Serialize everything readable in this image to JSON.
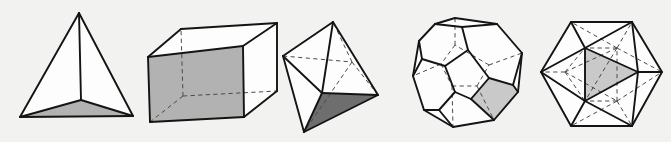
{
  "figure": {
    "background_color": "#f2f2f1",
    "width": 671,
    "height": 142,
    "line_color": "#141414",
    "hidden_line_color": "#4a4a4a",
    "hidden_line_style": "dashed",
    "face_white_color": "#fdfdfd",
    "shade_mid_color": "#b2b2b2",
    "shade_dark_color": "#6e6e6e",
    "shade_light_color": "#c9c9c9"
  },
  "solids": [
    {
      "id": "tetrahedron",
      "name": "Tetrahedron",
      "faces": 4,
      "face_shape": "triangle",
      "vertices": 4,
      "edges": 6,
      "shaded_face": "bottom-base",
      "shaded_face_color": "#b2b2b2",
      "hidden_edges_visible": false,
      "label": ""
    },
    {
      "id": "cube",
      "name": "Cube",
      "faces": 6,
      "face_shape": "square",
      "vertices": 8,
      "edges": 12,
      "shaded_face": "front-left",
      "shaded_face_color": "#b2b2b2",
      "hidden_edges_visible": true,
      "label": ""
    },
    {
      "id": "octahedron",
      "name": "Octahedron",
      "faces": 8,
      "face_shape": "triangle",
      "vertices": 6,
      "edges": 12,
      "shaded_face": "bottom-front",
      "shaded_face_color": "#6e6e6e",
      "hidden_edges_visible": true,
      "label": ""
    },
    {
      "id": "dodecahedron",
      "name": "Dodecahedron",
      "faces": 12,
      "face_shape": "pentagon",
      "vertices": 20,
      "edges": 30,
      "shaded_face": "lower-right",
      "shaded_face_color": "#c9c9c9",
      "hidden_edges_visible": true,
      "label": ""
    },
    {
      "id": "icosahedron",
      "name": "Icosahedron",
      "faces": 20,
      "face_shape": "triangle",
      "vertices": 12,
      "edges": 30,
      "shaded_face": "center-right",
      "shaded_face_color": "#c9c9c9",
      "hidden_edges_visible": true,
      "label": ""
    }
  ]
}
